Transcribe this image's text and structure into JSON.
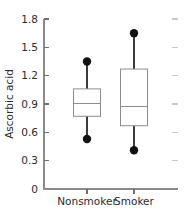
{
  "chart_data": {
    "type": "box",
    "title": "",
    "subtitle": "",
    "xlabel": "",
    "ylabel": "Ascorbic acid",
    "categories": [
      "Nonsmoker",
      "Smoker"
    ],
    "ylim": [
      0,
      1.8
    ],
    "yticks": [
      0,
      0.3,
      0.6,
      0.9,
      1.2,
      1.5,
      1.8
    ],
    "ytick_labels": [
      "0",
      "0.3",
      "0.6",
      "0.9",
      "1.2",
      "1.5",
      "1.8"
    ],
    "grid": false,
    "legend": "none",
    "series": [
      {
        "name": "Nonsmoker",
        "q1": 0.77,
        "median": 0.91,
        "q3": 1.06,
        "whisker_low": 0.53,
        "whisker_high": 1.35,
        "lower_point": 0.53,
        "upper_point": 1.35
      },
      {
        "name": "Smoker",
        "q1": 0.67,
        "median": 0.87,
        "q3": 1.27,
        "whisker_low": 0.41,
        "whisker_high": 1.65,
        "lower_point": 0.41,
        "upper_point": 1.65
      }
    ]
  },
  "axes": {
    "y_axis_label": "Ascorbic acid",
    "y_tick_0": "0",
    "y_tick_1": "0.3",
    "y_tick_2": "0.6",
    "y_tick_3": "0.9",
    "y_tick_4": "1.2",
    "y_tick_5": "1.5",
    "y_tick_6": "1.8",
    "x_cat_0": "Nonsmoker",
    "x_cat_1": "Smoker"
  },
  "colors": {
    "axis": "#8a8a8a",
    "tick": "#6f6f6f",
    "tick_right": "#c9c9c9",
    "box_stroke": "#8d8d8d",
    "box_fill": "#ffffff",
    "whisker": "#3a3a3a",
    "outlier": "#111111",
    "text": "#2b2b2b",
    "background": "#ffffff"
  }
}
